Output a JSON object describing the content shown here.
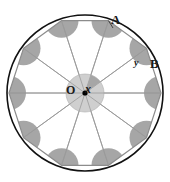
{
  "figure": {
    "kind": "geometry-diagram",
    "width": 170,
    "height": 182,
    "background_color": "#ffffff"
  },
  "labels": {
    "vertex_a": "A",
    "vertex_b": "B",
    "center": "O",
    "central_angle": "x",
    "interior_angle": "y"
  },
  "colors": {
    "outline": "#111111",
    "polygon_stroke": "#8c8c8c",
    "radius_stroke": "#9a9a9a",
    "sector_fill": "#a6a6a6",
    "center_disc_fill": "#cfcfcf",
    "center_sector_fill": "#a6a6a6",
    "point_fill": "#000000",
    "label_color": "#1a1a1a"
  },
  "geometry": {
    "circle": {
      "cx": 85,
      "cy": 93,
      "r": 78
    },
    "polygon": {
      "sides": 10,
      "circumradius": 76,
      "start_angle_deg": -72,
      "vertices": [
        {
          "id": "v0",
          "x": 108.49,
          "y": 20.71
        },
        {
          "id": "v1",
          "x": 157.29,
          "y": 56.17,
          "label": "B"
        },
        {
          "id": "v2",
          "x": 138.65,
          "y": 113.53
        },
        {
          "id": "v3",
          "x": 78.35,
          "y": 113.53
        },
        {
          "id": "v4",
          "x": 59.71,
          "y": 56.17
        },
        {
          "id": "v5",
          "x": 108.49,
          "y": 20.71
        }
      ]
    },
    "center_point": {
      "x": 85,
      "y": 93
    },
    "center_disc_radius": 19,
    "vertex_sector_radius": 17,
    "center_sector_span_deg": 36,
    "annotations": {
      "a_points_to_vertex_index": 1,
      "b_points_to_vertex_index": 2
    }
  },
  "measurements": {
    "central_angle_label": "x",
    "interior_angle_label": "y",
    "number_of_sides": 10,
    "number_of_radii": 10
  }
}
